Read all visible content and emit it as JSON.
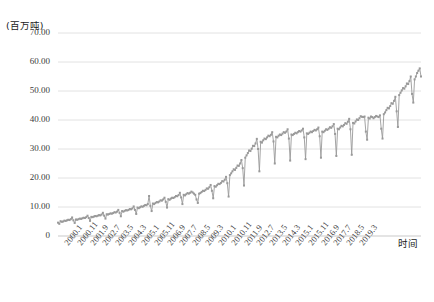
{
  "chart_data": {
    "type": "line",
    "title": "",
    "ylabel": "(百万吨)",
    "xlabel": "时间",
    "ylim": [
      0,
      70
    ],
    "yticks": [
      "0",
      "10.00",
      "20.00",
      "30.00",
      "40.00",
      "50.00",
      "60.00",
      "70.00"
    ],
    "ytick_values": [
      0,
      10,
      20,
      30,
      40,
      50,
      60,
      70
    ],
    "grid": "horizontal",
    "legend": "none",
    "line_color": "#9a9a9a",
    "marker": "square",
    "x_tick_labels": [
      "2000.1",
      "2000.11",
      "2001.9",
      "2002.7",
      "2003.5",
      "2004.3",
      "2005.1",
      "2005.11",
      "2006.9",
      "2007.7",
      "2008.5",
      "2009.3",
      "2010.1",
      "2010.11",
      "2011.9",
      "2012.7",
      "2013.5",
      "2014.3",
      "2015.1",
      "2015.11",
      "2016.9",
      "2017.7",
      "2018.5",
      "2019.3"
    ],
    "x_tick_step_months": 10,
    "x_start": "2000.1",
    "x_end": "2019.8",
    "values": [
      4.6,
      4.2,
      5.1,
      4.9,
      5.0,
      5.3,
      5.2,
      5.4,
      5.6,
      5.5,
      5.8,
      6.4,
      5.4,
      4.5,
      5.7,
      5.6,
      5.8,
      6.0,
      5.9,
      6.1,
      6.3,
      6.2,
      6.5,
      7.0,
      6.2,
      5.2,
      6.6,
      6.5,
      6.7,
      6.9,
      6.8,
      7.0,
      7.2,
      7.1,
      7.4,
      8.0,
      7.0,
      6.0,
      7.5,
      7.4,
      7.6,
      7.8,
      7.7,
      7.9,
      8.2,
      8.1,
      8.4,
      9.0,
      8.0,
      6.8,
      8.6,
      8.4,
      8.7,
      8.9,
      8.8,
      9.0,
      9.3,
      9.2,
      9.5,
      10.2,
      9.0,
      7.6,
      9.8,
      9.6,
      9.9,
      10.2,
      10.1,
      10.4,
      10.7,
      10.6,
      11.0,
      13.8,
      10.4,
      8.6,
      11.2,
      11.0,
      11.4,
      11.7,
      11.6,
      11.9,
      12.3,
      12.2,
      12.6,
      13.2,
      11.8,
      9.8,
      12.7,
      12.5,
      12.9,
      13.2,
      13.1,
      13.4,
      13.8,
      13.7,
      14.1,
      14.9,
      13.3,
      11.0,
      14.2,
      14.0,
      14.4,
      14.8,
      14.6,
      14.9,
      15.3,
      15.0,
      14.6,
      14.2,
      12.6,
      11.4,
      14.6,
      14.8,
      15.2,
      15.6,
      15.5,
      15.9,
      16.4,
      16.3,
      16.8,
      17.6,
      15.6,
      13.0,
      17.2,
      17.0,
      17.5,
      18.0,
      17.9,
      18.3,
      18.9,
      18.8,
      19.4,
      20.4,
      18.2,
      13.6,
      21.0,
      21.6,
      22.3,
      23.0,
      22.8,
      23.5,
      24.3,
      24.2,
      25.0,
      26.2,
      23.4,
      17.4,
      27.0,
      27.8,
      28.6,
      29.5,
      29.3,
      30.1,
      31.1,
      31.0,
      31.9,
      33.5,
      30.0,
      22.3,
      32.5,
      32.2,
      33.0,
      33.6,
      33.4,
      34.0,
      34.6,
      34.4,
      34.9,
      35.8,
      32.6,
      25.0,
      34.2,
      34.0,
      34.6,
      35.0,
      34.8,
      35.3,
      35.8,
      35.6,
      36.0,
      36.8,
      33.6,
      26.0,
      35.0,
      34.8,
      35.2,
      35.6,
      35.4,
      35.8,
      36.2,
      36.0,
      36.4,
      37.0,
      34.0,
      26.5,
      35.4,
      35.2,
      35.6,
      36.0,
      35.8,
      36.2,
      36.6,
      36.4,
      36.8,
      37.4,
      34.4,
      27.0,
      36.0,
      35.8,
      36.3,
      36.8,
      36.6,
      37.0,
      37.5,
      37.3,
      37.8,
      38.6,
      35.2,
      27.6,
      37.0,
      36.8,
      37.4,
      38.0,
      37.8,
      38.3,
      38.9,
      38.7,
      39.4,
      40.4,
      36.8,
      28.0,
      39.0,
      38.8,
      39.5,
      40.2,
      40.0,
      40.6,
      41.3,
      41.1,
      41.0,
      41.2,
      36.0,
      33.2,
      40.8,
      40.5,
      41.2,
      41.0,
      40.6,
      41.0,
      41.4,
      41.2,
      41.0,
      41.6,
      37.0,
      33.6,
      42.0,
      42.6,
      43.4,
      44.2,
      44.0,
      44.8,
      45.8,
      45.6,
      46.6,
      48.0,
      43.0,
      37.6,
      48.6,
      49.4,
      50.2,
      51.0,
      50.8,
      51.6,
      52.6,
      52.4,
      53.4,
      55.0,
      49.0,
      46.0,
      54.0,
      55.0,
      56.2,
      57.0,
      57.8,
      55.0
    ]
  }
}
